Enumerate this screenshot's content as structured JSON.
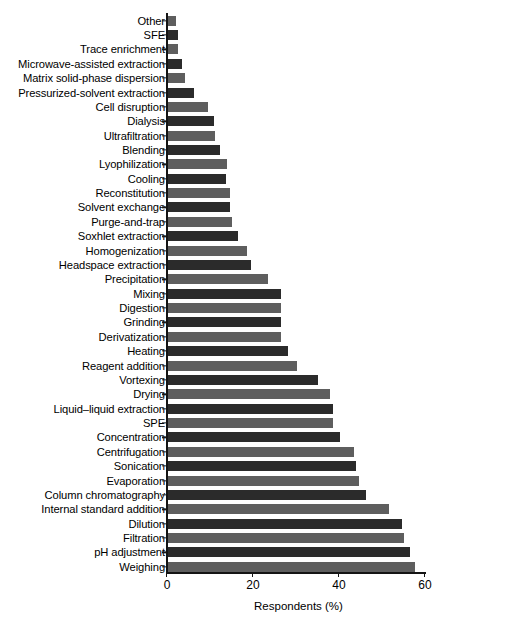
{
  "chart_data": {
    "type": "bar",
    "orientation": "horizontal",
    "title": "",
    "xlabel": "Respondents (%)",
    "ylabel": "",
    "xlim": [
      0,
      60
    ],
    "xticks": [
      0,
      20,
      40,
      60
    ],
    "grid": false,
    "legend": null,
    "bar_colors": [
      "#5e5e5e",
      "#2b2b2b"
    ],
    "categories": [
      "Other",
      "SFE",
      "Trace enrichment",
      "Microwave-assisted extraction",
      "Matrix solid-phase dispersion",
      "Pressurized-solvent extraction",
      "Cell disruption",
      "Dialysis",
      "Ultrafiltration",
      "Blending",
      "Lyophilization",
      "Cooling",
      "Reconstitution",
      "Solvent exchange",
      "Purge-and-trap",
      "Soxhlet extraction",
      "Homogenization",
      "Headspace extraction",
      "Precipitation",
      "Mixing",
      "Digestion",
      "Grinding",
      "Derivatization",
      "Heating",
      "Reagent addition",
      "Vortexing",
      "Drying",
      "Liquid–liquid extraction",
      "SPE",
      "Concentration",
      "Centrifugation",
      "Sonication",
      "Evaporation",
      "Column chromatography",
      "Internal standard addition",
      "Dilution",
      "Filtration",
      "pH adjustment",
      "Weighing"
    ],
    "values": [
      2.0,
      2.6,
      2.6,
      3.6,
      4.2,
      6.2,
      9.6,
      11.0,
      11.2,
      12.4,
      14.0,
      13.8,
      14.6,
      14.6,
      15.0,
      16.6,
      18.6,
      19.6,
      23.6,
      26.4,
      26.6,
      26.6,
      26.6,
      28.2,
      30.2,
      35.2,
      38.0,
      38.6,
      38.6,
      40.2,
      43.6,
      44.0,
      44.6,
      46.2,
      51.6,
      54.6,
      55.0,
      56.6,
      57.6
    ]
  },
  "axis": {
    "tick_labels": [
      "0",
      "20",
      "40",
      "60"
    ],
    "x_title": "Respondents (%)"
  },
  "caption": {
    "partial_text": ""
  }
}
